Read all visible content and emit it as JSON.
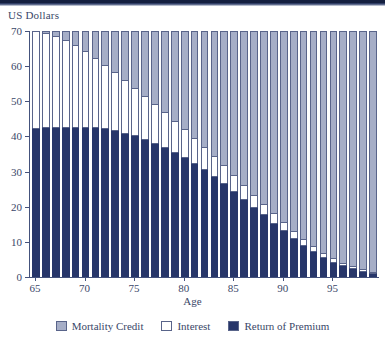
{
  "chart_data": {
    "type": "bar",
    "stacked": true,
    "title": "",
    "subtitle": "",
    "xlabel": "Age",
    "ylabel": "US Dollars",
    "ylim": [
      0,
      70
    ],
    "xlim": [
      64.4,
      99.6
    ],
    "grid": false,
    "legend_position": "bottom",
    "y_ticks": [
      0,
      10,
      20,
      30,
      40,
      50,
      60,
      70
    ],
    "x_ticks": [
      65,
      70,
      75,
      80,
      85,
      90,
      95
    ],
    "categories": [
      65,
      66,
      67,
      68,
      69,
      70,
      71,
      72,
      73,
      74,
      75,
      76,
      77,
      78,
      79,
      80,
      81,
      82,
      83,
      84,
      85,
      86,
      87,
      88,
      89,
      90,
      91,
      92,
      93,
      94,
      95,
      96,
      97,
      98,
      99
    ],
    "series": [
      {
        "name": "Return of Premium",
        "color": "#27366a",
        "values": [
          42.3,
          42.6,
          42.7,
          42.8,
          42.8,
          42.7,
          42.6,
          42.3,
          41.8,
          41.1,
          40.3,
          39.3,
          38.2,
          37.0,
          35.6,
          34.1,
          32.5,
          30.7,
          28.8,
          26.8,
          24.6,
          22.3,
          20.0,
          17.8,
          15.5,
          13.4,
          11.2,
          9.2,
          7.4,
          5.8,
          4.4,
          3.3,
          2.5,
          1.8,
          1.2
        ]
      },
      {
        "name": "Interest",
        "color": "#ffffff",
        "values": [
          27.7,
          26.9,
          25.9,
          24.6,
          23.1,
          21.5,
          19.8,
          18.1,
          16.4,
          14.9,
          13.5,
          12.2,
          11.0,
          9.9,
          8.9,
          8.0,
          7.2,
          6.4,
          5.7,
          5.0,
          4.4,
          3.9,
          3.4,
          3.0,
          2.6,
          2.2,
          1.9,
          1.6,
          1.3,
          1.1,
          0.9,
          0.7,
          0.5,
          0.4,
          0.3
        ]
      },
      {
        "name": "Mortality Credit",
        "color": "#a6aec7",
        "values": [
          0.0,
          0.5,
          1.4,
          2.6,
          4.1,
          5.8,
          7.6,
          9.6,
          11.8,
          14.0,
          16.2,
          18.5,
          20.8,
          23.1,
          25.5,
          27.9,
          30.3,
          32.9,
          35.5,
          38.2,
          41.0,
          43.8,
          46.6,
          49.2,
          51.9,
          54.4,
          56.9,
          59.2,
          61.3,
          63.1,
          64.7,
          66.0,
          67.0,
          67.8,
          68.5
        ]
      }
    ]
  },
  "axes": {
    "y_title": "US Dollars",
    "x_title": "Age"
  },
  "legend": {
    "items": [
      {
        "label": "Mortality Credit",
        "color": "#a6aec7"
      },
      {
        "label": "Interest",
        "color": "#ffffff"
      },
      {
        "label": "Return of Premium",
        "color": "#27366a"
      }
    ]
  }
}
